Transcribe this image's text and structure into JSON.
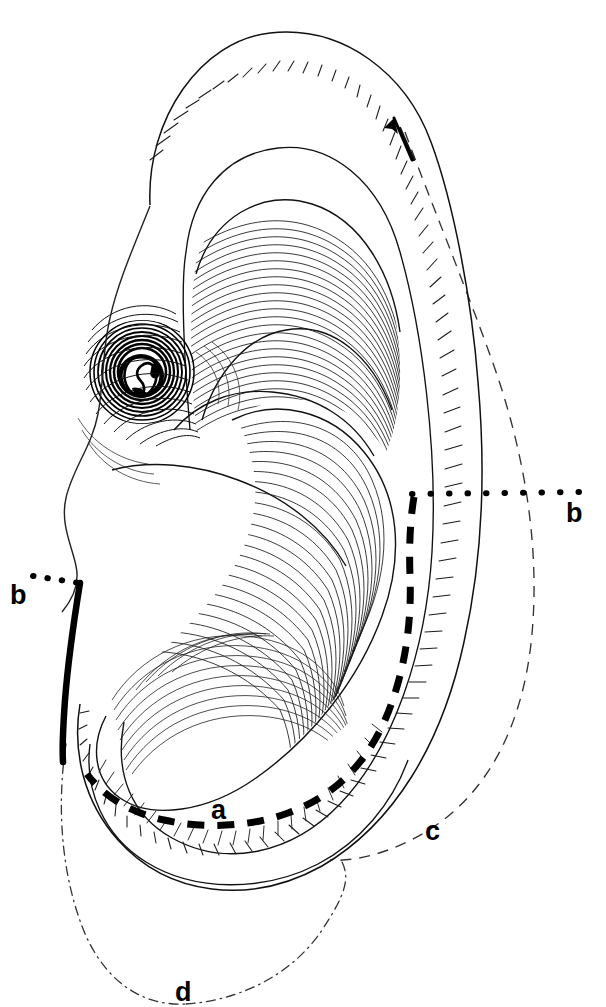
{
  "figure": {
    "domain": "anatomical-line-drawing",
    "view": "lateral",
    "background_color": "#ffffff",
    "ink_color": "#000000",
    "width_px": 606,
    "height_px": 1007
  },
  "labels": {
    "a": "a",
    "b_left": "b",
    "b_right": "b",
    "c": "c",
    "d": "d"
  },
  "markings": [
    {
      "id": "a",
      "label": "a",
      "style": "thick-dashed",
      "color": "#000000",
      "description": "thick dashed incision line along antihelix and around lower concha"
    },
    {
      "id": "b_left",
      "label": "b",
      "style": "dotted-leader-to-thick-solid",
      "color": "#000000",
      "description": "leader dots from left b label to thick solid line on anterior helix root"
    },
    {
      "id": "b_right",
      "label": "b",
      "style": "dotted-leader",
      "color": "#000000",
      "description": "horizontal dotted leader from right b label to the thick dashed line start"
    },
    {
      "id": "c",
      "label": "c",
      "style": "dashed-thin",
      "color": "#000000",
      "description": "thin dashed outer contour of the helix rim / projected outline"
    },
    {
      "id": "d",
      "label": "d",
      "style": "dash-dot-thin",
      "color": "#000000",
      "description": "thin dash-dot contour outlining the lobule below the ear"
    }
  ],
  "annotations": {
    "arrow": {
      "name": "direction-arrow",
      "direction": "up-left",
      "style": "solid-head-with-dashed-tail"
    }
  },
  "anatomy_parts": [
    "helix",
    "antihelix",
    "scapha",
    "triangular-fossa",
    "concha",
    "tragus",
    "external-acoustic-meatus",
    "lobule",
    "crus-of-helix"
  ],
  "colors": {
    "ink": "#000000",
    "hatch": "#1a1a1a",
    "paper": "#ffffff"
  }
}
